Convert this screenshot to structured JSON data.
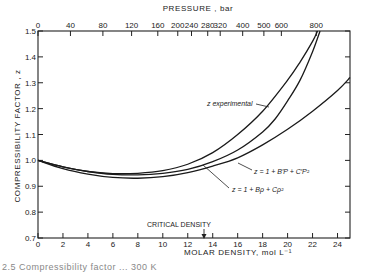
{
  "chart_data": {
    "type": "line",
    "title": "",
    "xlabel": "MOLAR DENSITY,  mol L⁻¹",
    "ylabel": "COMPRESSIBILITY  FACTOR ,  z",
    "top_axis_label": "PRESSURE ,  bar",
    "xlim": [
      0,
      25
    ],
    "ylim": [
      0.7,
      1.5
    ],
    "grid": false,
    "x_ticks": [
      0,
      2,
      4,
      6,
      8,
      10,
      12,
      14,
      16,
      18,
      20,
      22,
      24
    ],
    "y_ticks": [
      0.7,
      0.8,
      0.9,
      1.0,
      1.1,
      1.2,
      1.3,
      1.4,
      1.5
    ],
    "y_tick_labels": [
      "0.7",
      "0.8",
      "0.9",
      "1.0",
      "1.1",
      "1.2",
      "1.3",
      "1.4",
      "1.5"
    ],
    "top_ticks": [
      {
        "label": "0",
        "density": 0
      },
      {
        "label": "40",
        "density": 2.6
      },
      {
        "label": "80",
        "density": 5.2
      },
      {
        "label": "120",
        "density": 7.5
      },
      {
        "label": "160",
        "density": 9.6
      },
      {
        "label": "200",
        "density": 11.2
      },
      {
        "label": "240",
        "density": 12.3
      },
      {
        "label": "280",
        "density": 13.6
      },
      {
        "label": "320",
        "density": 14.6
      },
      {
        "label": "400",
        "density": 16.4
      },
      {
        "label": "500",
        "density": 18.1
      },
      {
        "label": "600",
        "density": 19.5
      },
      {
        "label": "800",
        "density": 22.3
      }
    ],
    "annotation": {
      "text": "CRITICAL DENSITY",
      "x": 13.3
    },
    "series": [
      {
        "name": "z experimental",
        "x": [
          0,
          2,
          4,
          6,
          8,
          10,
          12,
          14,
          16,
          18,
          20,
          21,
          22,
          22.4
        ],
        "y": [
          1.0,
          0.975,
          0.957,
          0.949,
          0.95,
          0.96,
          0.985,
          1.03,
          1.1,
          1.19,
          1.31,
          1.38,
          1.46,
          1.5
        ]
      },
      {
        "name": "z = 1 + B′P + C′P²",
        "x": [
          0,
          2,
          4,
          6,
          8,
          10,
          12,
          14,
          16,
          18,
          19,
          20,
          21,
          22,
          22.6
        ],
        "y": [
          1.0,
          0.975,
          0.957,
          0.946,
          0.944,
          0.95,
          0.965,
          0.995,
          1.04,
          1.11,
          1.16,
          1.23,
          1.31,
          1.42,
          1.5
        ]
      },
      {
        "name": "z = 1 + Bρ + Cρ²",
        "x": [
          0,
          2,
          4,
          6,
          8,
          10,
          12,
          14,
          16,
          18,
          20,
          22,
          24,
          25
        ],
        "y": [
          1.0,
          0.968,
          0.947,
          0.934,
          0.931,
          0.937,
          0.953,
          0.978,
          1.01,
          1.06,
          1.12,
          1.19,
          1.27,
          1.32
        ]
      }
    ],
    "legend": "inline labels"
  },
  "labels": {
    "z_experimental": "z experimental",
    "virial_pressure": "z = 1 + B′P + C′P²",
    "virial_density": "z = 1 + Bρ + Cρ²",
    "critical_density": "CRITICAL DENSITY",
    "pressure_axis": "PRESSURE ,  bar",
    "density_axis": "MOLAR DENSITY,  mol L⁻¹",
    "z_axis": "COMPRESSIBILITY  FACTOR ,  z"
  },
  "caption": "2.5  Compressibility factor ... 300 K"
}
